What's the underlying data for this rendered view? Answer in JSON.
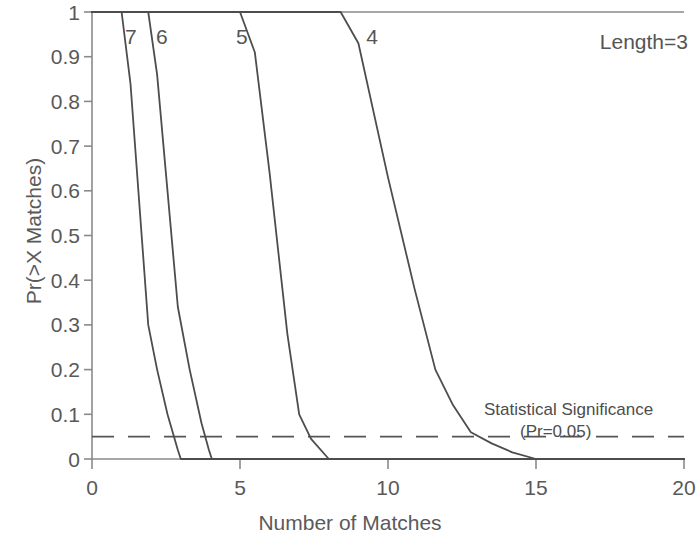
{
  "chart_data": {
    "type": "line",
    "title": "",
    "xlabel": "Number of Matches",
    "ylabel": "Pr(>X Matches)",
    "xlim": [
      0,
      20
    ],
    "ylim": [
      0,
      1
    ],
    "xticks": [
      "0",
      "5",
      "10",
      "15",
      "20"
    ],
    "xtick_values": [
      0,
      5,
      10,
      15,
      20
    ],
    "yticks": [
      "0",
      "0.1",
      "0.2",
      "0.3",
      "0.4",
      "0.5",
      "0.6",
      "0.7",
      "0.8",
      "0.9",
      "1"
    ],
    "ytick_values": [
      0,
      0.1,
      0.2,
      0.3,
      0.4,
      0.5,
      0.6,
      0.7,
      0.8,
      0.9,
      1
    ],
    "grid": false,
    "legend_position": "inline-curve-labels",
    "corner_annotation": "Length=3",
    "series": [
      {
        "name": "7",
        "label": "7",
        "label_x": 1.35,
        "label_y": 0.945,
        "x": [
          0,
          1.0,
          1.3,
          1.9,
          2.2,
          2.55,
          2.9,
          3.0,
          20
        ],
        "y": [
          1,
          1,
          0.84,
          0.3,
          0.2,
          0.1,
          0.02,
          0,
          0
        ]
      },
      {
        "name": "6",
        "label": "6",
        "label_x": 2.4,
        "label_y": 0.945,
        "x": [
          0,
          1.9,
          2.2,
          2.9,
          3.3,
          3.7,
          3.95,
          4.05,
          20
        ],
        "y": [
          1,
          1,
          0.86,
          0.34,
          0.2,
          0.08,
          0.02,
          0,
          0
        ]
      },
      {
        "name": "5",
        "label": "5",
        "label_x": 5.1,
        "label_y": 0.945,
        "x": [
          0,
          3.6,
          5.0,
          5.5,
          6.0,
          6.6,
          7.0,
          7.4,
          8.0,
          20
        ],
        "y": [
          1,
          1,
          1.0,
          0.91,
          0.64,
          0.28,
          0.1,
          0.045,
          0,
          0
        ]
      },
      {
        "name": "4",
        "label": "4",
        "label_x": 9.5,
        "label_y": 0.945,
        "x": [
          0,
          7.1,
          8.4,
          9.0,
          10.0,
          10.9,
          11.6,
          12.2,
          12.8,
          13.5,
          14.2,
          15.0,
          20
        ],
        "y": [
          1,
          1,
          1.0,
          0.93,
          0.63,
          0.38,
          0.2,
          0.12,
          0.06,
          0.035,
          0.015,
          0,
          0
        ]
      }
    ],
    "reference_line": {
      "name": "statistical-significance",
      "value": 0.05,
      "style": "dashed",
      "label_line1": "Statistical Significance",
      "label_line2": "(Pr=0.05)"
    },
    "colors": {
      "curve": "#4d4d4d",
      "axis": "#808080",
      "reference": "#555555",
      "text": "#4d4d4d",
      "background": "#ffffff"
    }
  }
}
